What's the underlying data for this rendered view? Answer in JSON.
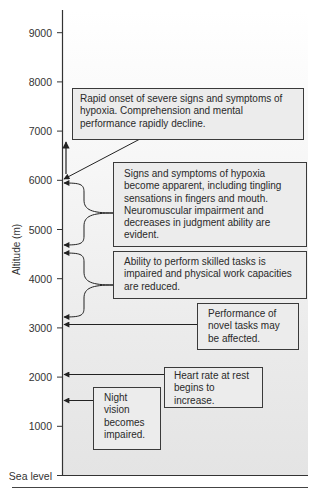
{
  "diagram": {
    "y_axis": {
      "title": "Altitude (m)",
      "ticks": [
        {
          "label": "9000",
          "value": 9000
        },
        {
          "label": "8000",
          "value": 8000
        },
        {
          "label": "7000",
          "value": 7000
        },
        {
          "label": "6000",
          "value": 6000
        },
        {
          "label": "5000",
          "value": 5000
        },
        {
          "label": "4000",
          "value": 4000
        },
        {
          "label": "3000",
          "value": 3000
        },
        {
          "label": "2000",
          "value": 2000
        },
        {
          "label": "1000",
          "value": 1000
        },
        {
          "label": "Sea level",
          "value": 0
        }
      ]
    },
    "annotations": [
      {
        "text": "Rapid onset of severe signs and symptoms of hypoxia. Comprehension and mental performance rapidly decline.",
        "altitude_m": "6000+",
        "points_to": [
          6000
        ],
        "upward_arrow": true
      },
      {
        "text": "Signs and symptoms of hypoxia become apparent, including tingling sensations in fingers and mouth. Neuromuscular impairment and decreases in judgment ability are evident.",
        "range_m": [
          4600,
          5900
        ]
      },
      {
        "text": "Ability to perform skilled tasks is impaired and physical work capacities are reduced.",
        "range_m": [
          3200,
          4500
        ]
      },
      {
        "text": "Performance of novel tasks may be affected.",
        "points_to": [
          3050
        ]
      },
      {
        "text": "Heart rate at rest begins to increase.",
        "points_to": [
          2050
        ]
      },
      {
        "text": "Night vision becomes impaired.",
        "points_to": [
          1550
        ]
      }
    ]
  }
}
